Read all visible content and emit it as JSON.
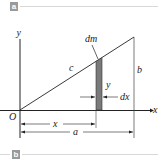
{
  "panels": [
    {
      "badge": "a"
    },
    {
      "badge": "b"
    }
  ],
  "diagram": {
    "labels": {
      "y_axis": "y",
      "x_axis": "x",
      "origin": "O",
      "hypotenuse": "c",
      "height": "b",
      "element": "dm",
      "strip_height": "y",
      "strip_width": "dx",
      "x_dimension": "x",
      "base_dimension": "a"
    },
    "colors": {
      "line": "#222222",
      "strip_fill": "#7a7a7a",
      "badge": "#9a9a9a",
      "rule": "#d8d8d8"
    }
  }
}
